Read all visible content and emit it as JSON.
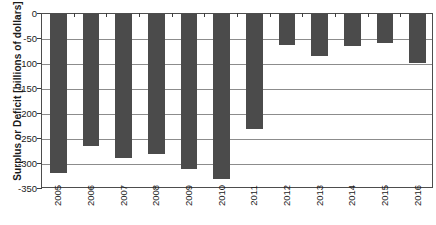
{
  "chart_data": {
    "type": "bar",
    "title": "",
    "xlabel": "",
    "ylabel": "Surplus or Deficit [billions of dollars]",
    "categories": [
      "2005",
      "2006",
      "2007",
      "2008",
      "2009",
      "2010",
      "2011",
      "2012",
      "2013",
      "2014",
      "2015",
      "2016"
    ],
    "values": [
      -318,
      -264,
      -288,
      -280,
      -310,
      -330,
      -230,
      -62,
      -84,
      -64,
      -58,
      -98
    ],
    "ylim": [
      -350,
      0
    ],
    "ytick_labels": [
      "0",
      "-50",
      "-100",
      "-150",
      "-200",
      "-250",
      "-300",
      "-350"
    ],
    "ytick_values": [
      0,
      -50,
      -100,
      -150,
      -200,
      -250,
      -300,
      -350
    ],
    "grid": true,
    "legend": "none",
    "bar_color": "#4b4b4b",
    "grid_color": "#8c8c8c",
    "axis_color": "#4d4d4d"
  }
}
